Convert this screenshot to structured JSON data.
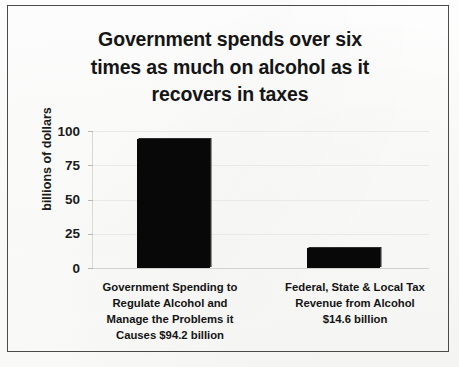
{
  "chart_data": {
    "type": "bar",
    "title": "Government spends over six times as much on alcohol as it recovers in taxes",
    "title_lines": [
      "Government spends over six",
      "times as much on alcohol as it",
      "recovers in taxes"
    ],
    "xlabel": "",
    "ylabel": "billions of dollars",
    "categories": [
      "Government Spending to Regulate Alcohol and Manage the Problems it Causes   $94.2 billion",
      "Federal, State & Local Tax Revenue from Alcohol $14.6 billion"
    ],
    "category_lines": [
      [
        "Government Spending to",
        "Regulate Alcohol and",
        "Manage the Problems it",
        "Causes   $94.2 billion"
      ],
      [
        "Federal, State & Local Tax",
        "Revenue from Alcohol",
        "$14.6 billion"
      ]
    ],
    "values": [
      94.2,
      14.6
    ],
    "value_labels": [
      "$94.2 billion",
      "$14.6 billion"
    ],
    "ylim": [
      0,
      100
    ],
    "yticks": [
      "0",
      "25",
      "50",
      "75",
      "100"
    ],
    "ytick_values": [
      0,
      25,
      50,
      75,
      100
    ],
    "grid": true,
    "legend": false,
    "bar_color": "#080808",
    "grid_color": "#e9e9e9",
    "text_color": "#151515",
    "frame_color": "#4a4a4a",
    "background": "#fdfdfd"
  }
}
